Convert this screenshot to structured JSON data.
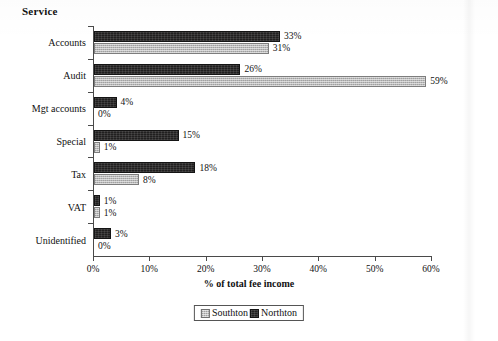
{
  "chart_data": {
    "type": "bar",
    "orientation": "horizontal",
    "title": "Service",
    "xlabel": "% of total fee income",
    "ylabel": "",
    "xlim": [
      0,
      60
    ],
    "xticks": [
      "0%",
      "10%",
      "20%",
      "30%",
      "40%",
      "50%",
      "60%"
    ],
    "xtick_values": [
      0,
      10,
      20,
      30,
      40,
      50,
      60
    ],
    "grid": false,
    "legend_position": "bottom-center",
    "categories": [
      "Accounts",
      "Audit",
      "Mgt accounts",
      "Special",
      "Tax",
      "VAT",
      "Unidentified"
    ],
    "series": [
      {
        "name": "Northton",
        "color": "#201f1f",
        "values": [
          33,
          26,
          4,
          15,
          18,
          1,
          3
        ],
        "labels": [
          "33%",
          "26%",
          "4%",
          "15%",
          "18%",
          "1%",
          "3%"
        ]
      },
      {
        "name": "Southton",
        "color": "#b9b9b9",
        "values": [
          31,
          59,
          0,
          1,
          8,
          1,
          0
        ],
        "labels": [
          "31%",
          "59%",
          "0%",
          "1%",
          "8%",
          "1%",
          "0%"
        ]
      }
    ]
  },
  "legend": {
    "items": [
      {
        "label": "Southton",
        "swatch": "light"
      },
      {
        "label": "Northton",
        "swatch": "dark"
      }
    ]
  }
}
